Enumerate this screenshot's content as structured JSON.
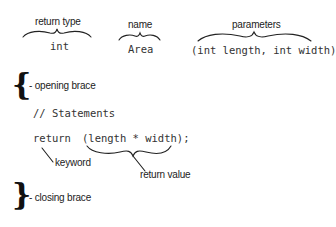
{
  "diagram": {
    "top_labels": {
      "return_type": "return type",
      "name": "name",
      "parameters": "parameters"
    },
    "signature": {
      "return_type": "int",
      "name": "Area",
      "parameters": "(int length, int width)"
    },
    "body": {
      "opening_brace_glyph": "{",
      "opening_brace_label": "- opening brace",
      "comment": "// Statements",
      "return_keyword": "return",
      "return_expression": "(length * width);",
      "keyword_label": "keyword",
      "return_value_label": "return value",
      "closing_brace_glyph": "}",
      "closing_brace_label": "- closing brace"
    },
    "colors": {
      "text": "#222222",
      "code": "#333333",
      "lines": "#222222",
      "background": "#ffffff"
    }
  }
}
